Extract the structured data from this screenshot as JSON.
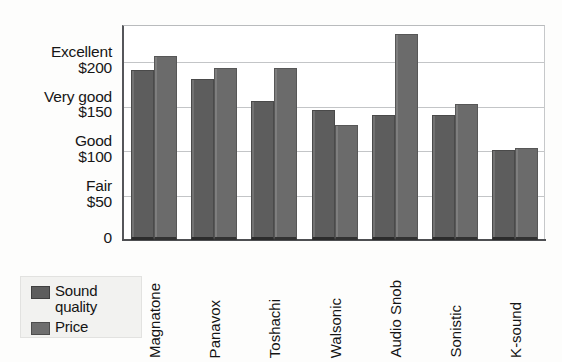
{
  "chart_data": {
    "type": "bar",
    "title": "",
    "xlabel": "",
    "ylabel": "",
    "ylim": [
      0,
      240
    ],
    "grid": true,
    "legend_position": "bottom-left",
    "categories": [
      "Magnatone",
      "Panavox",
      "Toshachi",
      "Walsonic",
      "Audio Snob",
      "Sonistic",
      "K-sound"
    ],
    "series": [
      {
        "name": "Sound quality",
        "color": "#5d5d5d",
        "values": [
          190,
          180,
          155,
          145,
          140,
          140,
          100
        ]
      },
      {
        "name": "Price",
        "color": "#6e6e6e",
        "values": [
          205,
          192,
          192,
          128,
          230,
          152,
          103
        ]
      }
    ],
    "y_ticks": [
      {
        "value": 0,
        "money": "0",
        "word": ""
      },
      {
        "value": 50,
        "money": "$50",
        "word": "Fair"
      },
      {
        "value": 100,
        "money": "$100",
        "word": "Good"
      },
      {
        "value": 150,
        "money": "$150",
        "word": "Very good"
      },
      {
        "value": 200,
        "money": "$200",
        "word": "Excellent"
      }
    ]
  },
  "legend": {
    "items": [
      {
        "label_line1": "Sound",
        "label_line2": "quality",
        "series": "Sound quality"
      },
      {
        "label_line1": "Price",
        "label_line2": "",
        "series": "Price"
      }
    ]
  }
}
